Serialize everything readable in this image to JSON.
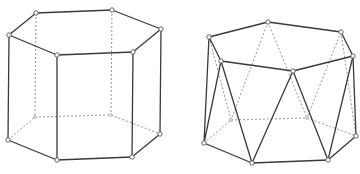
{
  "figures": [
    {
      "name": "hexagonal-prism",
      "vertices": {
        "T0": [
          36,
          13
        ],
        "T1": [
          112,
          10
        ],
        "T2": [
          161,
          29
        ],
        "T3": [
          133,
          52
        ],
        "T4": [
          57,
          55
        ],
        "T5": [
          9,
          35
        ],
        "B0": [
          35,
          117
        ],
        "B1": [
          111,
          115
        ],
        "B2": [
          160,
          134
        ],
        "B3": [
          132,
          157
        ],
        "B4": [
          57,
          160
        ],
        "B5": [
          8,
          140
        ]
      },
      "solid_edges": [
        [
          "T0",
          "T1"
        ],
        [
          "T1",
          "T2"
        ],
        [
          "T2",
          "T3"
        ],
        [
          "T3",
          "T4"
        ],
        [
          "T4",
          "T5"
        ],
        [
          "T5",
          "T0"
        ],
        [
          "T5",
          "B5"
        ],
        [
          "T4",
          "B4"
        ],
        [
          "T3",
          "B3"
        ],
        [
          "T2",
          "B2"
        ],
        [
          "B5",
          "B4"
        ],
        [
          "B4",
          "B3"
        ],
        [
          "B3",
          "B2"
        ]
      ],
      "dashed_edges": [
        [
          "T0",
          "B0"
        ],
        [
          "T1",
          "B1"
        ],
        [
          "B5",
          "B0"
        ],
        [
          "B0",
          "B1"
        ],
        [
          "B1",
          "B2"
        ]
      ],
      "hidden_vertices": [
        "B0",
        "B1"
      ]
    },
    {
      "name": "hexagonal-antiprism",
      "vertices": {
        "T0": [
          209,
          37
        ],
        "T1": [
          268,
          22
        ],
        "T2": [
          341,
          32
        ],
        "T3": [
          353,
          56
        ],
        "T4": [
          293,
          71
        ],
        "T5": [
          221,
          61
        ],
        "B0": [
          231,
          120
        ],
        "B1": [
          307,
          118
        ],
        "B2": [
          356,
          136
        ],
        "B3": [
          328,
          160
        ],
        "B4": [
          252,
          163
        ],
        "B5": [
          204,
          143
        ]
      },
      "solid_edges": [
        [
          "T0",
          "T1"
        ],
        [
          "T1",
          "T2"
        ],
        [
          "T2",
          "T3"
        ],
        [
          "T3",
          "T4"
        ],
        [
          "T4",
          "T5"
        ],
        [
          "T5",
          "T0"
        ],
        [
          "T0",
          "B5"
        ],
        [
          "T5",
          "B5"
        ],
        [
          "T5",
          "B4"
        ],
        [
          "T4",
          "B4"
        ],
        [
          "T4",
          "B3"
        ],
        [
          "T3",
          "B3"
        ],
        [
          "T3",
          "B2"
        ],
        [
          "B5",
          "B4"
        ],
        [
          "B4",
          "B3"
        ],
        [
          "B3",
          "B2"
        ]
      ],
      "dashed_edges": [
        [
          "T0",
          "B0"
        ],
        [
          "T1",
          "B0"
        ],
        [
          "T1",
          "B1"
        ],
        [
          "T2",
          "B1"
        ],
        [
          "T2",
          "B2"
        ],
        [
          "B5",
          "B0"
        ],
        [
          "B0",
          "B1"
        ],
        [
          "B1",
          "B2"
        ]
      ],
      "hidden_vertices": [
        "B0",
        "B1"
      ]
    }
  ]
}
